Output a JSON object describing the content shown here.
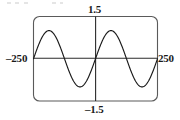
{
  "figure": {
    "kind": "graphing-calculator-viewport"
  },
  "labels": {
    "y_max": "1.5",
    "y_min": "–1.5",
    "x_min": "–250",
    "x_max": "250"
  },
  "colors": {
    "curve": "#1a1a1a",
    "axis": "#2b2b2b",
    "frame": "#555555",
    "background": "#ffffff",
    "label": "#1a1a1a"
  },
  "chart_data": {
    "type": "line",
    "title": "",
    "xlabel": "",
    "ylabel": "",
    "xlim": [
      -250,
      250
    ],
    "ylim": [
      -1.5,
      1.5
    ],
    "grid": false,
    "legend": null,
    "axis_tick_labels": {
      "x": [
        "–250",
        "250"
      ],
      "y": [
        "–1.5",
        "1.5"
      ]
    },
    "series": [
      {
        "name": "sine",
        "formula": "y = sin(2πx/250)",
        "amplitude": 1.0,
        "period": 250,
        "cycles_shown": 2,
        "x": [
          -250,
          -234,
          -219,
          -203,
          -188,
          -172,
          -156,
          -141,
          -125,
          -109,
          -94,
          -78,
          -63,
          -47,
          -31,
          -16,
          0,
          16,
          31,
          47,
          63,
          78,
          94,
          109,
          125,
          141,
          156,
          172,
          188,
          203,
          219,
          234,
          250
        ],
        "values": [
          0,
          -0.38,
          -0.71,
          -0.92,
          -1.0,
          -0.92,
          -0.71,
          -0.38,
          0,
          0.38,
          0.71,
          0.92,
          1.0,
          0.92,
          0.71,
          0.38,
          0,
          -0.38,
          -0.71,
          -0.92,
          -1.0,
          -0.92,
          -0.71,
          -0.38,
          0,
          0.38,
          0.71,
          0.92,
          1.0,
          0.92,
          0.71,
          0.38,
          0
        ]
      }
    ],
    "key_points": {
      "maxima_x": [
        -188,
        63
      ],
      "minima_x": [
        -63,
        188
      ],
      "zeros_x": [
        -250,
        -125,
        0,
        125,
        250
      ]
    }
  }
}
